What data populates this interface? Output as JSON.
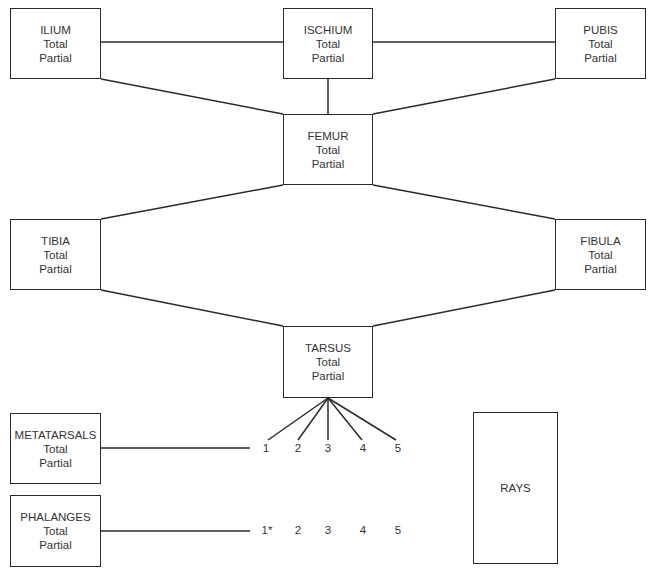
{
  "diagram": {
    "line_color": "#2a2a2a",
    "nodes": [
      {
        "id": "ilium",
        "label": "ILIUM",
        "line1": "Total",
        "line2": "Partial",
        "x": 10,
        "y": 8,
        "w": 91,
        "h": 71
      },
      {
        "id": "ischium",
        "label": "ISCHIUM",
        "line1": "Total",
        "line2": "Partial",
        "x": 283,
        "y": 8,
        "w": 90,
        "h": 71
      },
      {
        "id": "pubis",
        "label": "PUBIS",
        "line1": "Total",
        "line2": "Partial",
        "x": 555,
        "y": 8,
        "w": 91,
        "h": 71
      },
      {
        "id": "femur",
        "label": "FEMUR",
        "line1": "Total",
        "line2": "Partial",
        "x": 283,
        "y": 114,
        "w": 90,
        "h": 71
      },
      {
        "id": "tibia",
        "label": "TIBIA",
        "line1": "Total",
        "line2": "Partial",
        "x": 10,
        "y": 219,
        "w": 91,
        "h": 71
      },
      {
        "id": "fibula",
        "label": "FIBULA",
        "line1": "Total",
        "line2": "Partial",
        "x": 555,
        "y": 219,
        "w": 91,
        "h": 71
      },
      {
        "id": "tarsus",
        "label": "TARSUS",
        "line1": "Total",
        "line2": "Partial",
        "x": 283,
        "y": 326,
        "w": 90,
        "h": 72
      },
      {
        "id": "metatarsals",
        "label": "METATARSALS",
        "line1": "Total",
        "line2": "Partial",
        "x": 10,
        "y": 413,
        "w": 91,
        "h": 71
      },
      {
        "id": "phalanges",
        "label": "PHALANGES",
        "line1": "Total",
        "line2": "Partial",
        "x": 10,
        "y": 495,
        "w": 91,
        "h": 72
      },
      {
        "id": "rays",
        "label": "RAYS",
        "x": 473,
        "y": 412,
        "w": 85,
        "h": 152
      }
    ],
    "metatarsal_numbers": [
      "1",
      "2",
      "3",
      "4",
      "5"
    ],
    "phalanx_numbers": [
      "1*",
      "2",
      "3",
      "4",
      "5"
    ]
  }
}
